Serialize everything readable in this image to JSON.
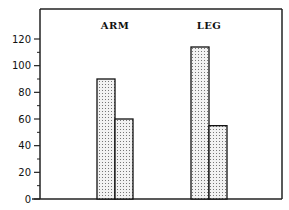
{
  "chart_data": {
    "type": "bar",
    "title": "",
    "xlabel": "",
    "ylabel": "",
    "categories": [
      "ARM",
      "LEG"
    ],
    "series": [
      {
        "name": "series-1",
        "values": [
          90,
          114
        ]
      },
      {
        "name": "series-2",
        "values": [
          60,
          55
        ]
      }
    ],
    "ylim": [
      0,
      130
    ],
    "yticks": [
      0,
      20,
      40,
      60,
      80,
      100,
      120
    ],
    "minor_yticks": [
      10,
      30,
      50,
      70,
      90,
      110
    ],
    "grid": false,
    "legend": "none",
    "fill_pattern": "dotted-stipple"
  }
}
